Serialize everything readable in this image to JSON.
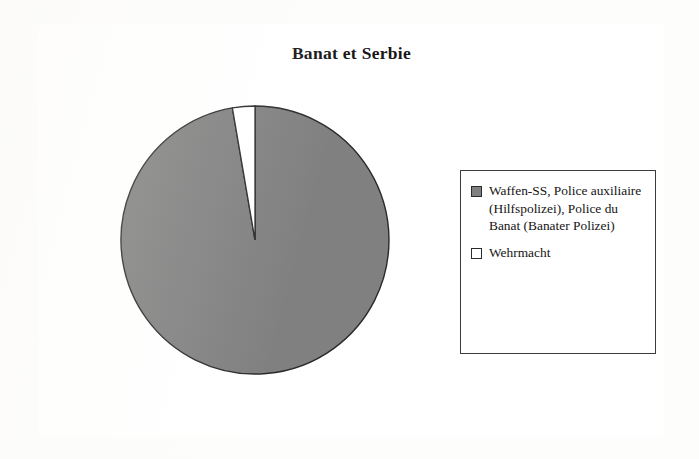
{
  "document": {
    "background_color": "#fdfdfc",
    "frame_border_color": "#3a3a3a"
  },
  "chart_data": {
    "type": "pie",
    "title": "Banat et Serbie",
    "xlabel": "",
    "ylabel": "",
    "grid": false,
    "legend_position": "right",
    "categories": [
      "Waffen-SS, Police auxiliaire (Hilfspolizei), Police du Banat (Banater Polizei)",
      "Wehrmacht"
    ],
    "values": [
      97.3,
      2.7
    ],
    "slices": [
      {
        "label": "Waffen-SS, Police auxiliaire (Hilfspolizei), Police du Banat (Banater Polizei)",
        "value": 97.3,
        "color": "#808080",
        "start_angle_deg": 0,
        "sweep_deg": 350.3
      },
      {
        "label": "Wehrmacht",
        "value": 2.7,
        "color": "#ffffff",
        "start_angle_deg": 350.3,
        "sweep_deg": 9.7
      }
    ],
    "colors": [
      "#808080",
      "#ffffff"
    ],
    "slice_border_color": "#2a2a2a",
    "start_angle_note": "first slice begins at 12 o'clock and sweeps clockwise"
  },
  "legend": {
    "entries": [
      {
        "label": "Waffen-SS, Police auxiliaire (Hilfspolizei), Police du Banat (Banater Polizei)",
        "swatch_color": "#808080",
        "swatch_name": "legend-swatch-gray"
      },
      {
        "label": "Wehrmacht",
        "swatch_color": "#ffffff",
        "swatch_name": "legend-swatch-white"
      }
    ]
  }
}
